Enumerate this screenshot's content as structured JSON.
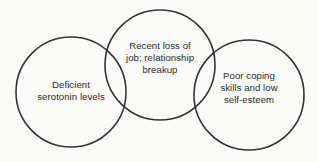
{
  "diagram": {
    "type": "venn-three-circle-chain",
    "background_color": "#fbfbf9",
    "stroke_color": "#333333",
    "text_color": "#2b2b2b",
    "circles": [
      {
        "id": "left",
        "name": "deficient-serotonin-levels",
        "text": "Deficient\nserotonin levels",
        "cx": 71,
        "cy": 92,
        "r": 55
      },
      {
        "id": "middle",
        "name": "recent-loss-of-job-relationship-breakup",
        "text": "Recent loss of\njob; relationship\nbreakup",
        "cx": 160,
        "cy": 65,
        "r": 55
      },
      {
        "id": "right",
        "name": "poor-coping-skills-low-self-esteem",
        "text": "Poor coping\nskills and low\nself-esteem",
        "cx": 249,
        "cy": 95,
        "r": 55
      }
    ]
  }
}
